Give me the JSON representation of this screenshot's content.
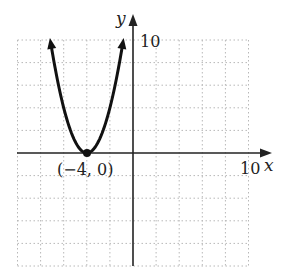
{
  "chart_data": {
    "type": "line",
    "title": "",
    "xlabel": "x",
    "ylabel": "y",
    "xlim": [
      -10,
      10
    ],
    "ylim": [
      -10,
      10
    ],
    "grid": true,
    "grid_step": 2,
    "tick_labels": {
      "x": "10",
      "y": "10"
    },
    "series": [
      {
        "name": "y = (x + 4)^2",
        "equation": "y = (x+4)^2",
        "x": [
          -7.2,
          -7,
          -6,
          -5,
          -4,
          -3,
          -2,
          -1,
          -0.8
        ],
        "y": [
          10.24,
          9,
          4,
          1,
          0,
          1,
          4,
          9,
          10.24
        ]
      }
    ],
    "annotations": [
      {
        "point": [
          -4,
          0
        ],
        "label": "(−4, 0)"
      }
    ],
    "legend": "none"
  },
  "labels": {
    "x_axis": "x",
    "y_axis": "y",
    "x_tick": "10",
    "y_tick": "10",
    "vertex": "(−4, 0)"
  },
  "colors": {
    "curve": "#111111",
    "axis": "#222222",
    "grid": "#b8b8b8"
  }
}
